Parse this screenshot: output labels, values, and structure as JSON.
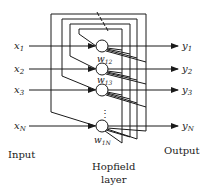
{
  "diagram": {
    "inputs": [
      {
        "var": "x",
        "sub": "1"
      },
      {
        "var": "x",
        "sub": "2"
      },
      {
        "var": "x",
        "sub": "3"
      },
      {
        "var": "x",
        "sub": "N"
      }
    ],
    "outputs": [
      {
        "var": "y",
        "sub": "1"
      },
      {
        "var": "y",
        "sub": "2"
      },
      {
        "var": "y",
        "sub": "3"
      },
      {
        "var": "y",
        "sub": "N"
      }
    ],
    "weights": [
      {
        "var": "w",
        "sub": "12"
      },
      {
        "var": "w",
        "sub": "13"
      },
      {
        "var": "w",
        "sub": "1N"
      }
    ],
    "ellipsis": "⋮",
    "labels": {
      "input": "Input",
      "output": "Output",
      "layer_line1": "Hopfield",
      "layer_line2": "layer"
    },
    "colors": {
      "line": "#1a1a1a",
      "background": "#ffffff"
    }
  }
}
